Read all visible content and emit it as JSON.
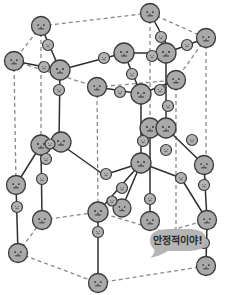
{
  "diagram": {
    "speech_bubble": {
      "text": "안정적이야!"
    },
    "colors": {
      "atom_fill": "#a9a9a9",
      "atom_stroke": "#3a3a3a",
      "bond": "#2e2e2e",
      "cell_edge": "#8a8a8a",
      "bubble": "#b5b5b5",
      "face": "#2a2a2a"
    },
    "oxygen_atoms": [
      {
        "x": 41,
        "y": 26
      },
      {
        "x": 150,
        "y": 13
      },
      {
        "x": 14,
        "y": 61
      },
      {
        "x": 60,
        "y": 70
      },
      {
        "x": 124,
        "y": 53
      },
      {
        "x": 206,
        "y": 38
      },
      {
        "x": 97,
        "y": 87
      },
      {
        "x": 141,
        "y": 94
      },
      {
        "x": 204,
        "y": 79
      },
      {
        "x": 176,
        "y": 80
      },
      {
        "x": 162,
        "y": 131
      },
      {
        "x": 41,
        "y": 145
      },
      {
        "x": 61,
        "y": 142
      },
      {
        "x": 150,
        "y": 128
      },
      {
        "x": 141,
        "y": 163
      },
      {
        "x": 16,
        "y": 185
      },
      {
        "x": 109,
        "y": 213
      },
      {
        "x": 98,
        "y": 212
      },
      {
        "x": 207,
        "y": 220
      },
      {
        "x": 165,
        "y": 232
      },
      {
        "x": 42,
        "y": 220
      },
      {
        "x": 18,
        "y": 253
      },
      {
        "x": 206,
        "y": 266
      },
      {
        "x": 98,
        "y": 283
      },
      {
        "x": 122,
        "y": 208
      },
      {
        "x": 150,
        "y": 221
      },
      {
        "x": 41,
        "y": 174
      }
    ],
    "hydrogen_atoms": [
      {
        "x": 48,
        "y": 44
      },
      {
        "x": 44,
        "y": 66
      },
      {
        "x": 59,
        "y": 89
      },
      {
        "x": 104,
        "y": 60
      },
      {
        "x": 161,
        "y": 37
      },
      {
        "x": 166,
        "y": 43
      },
      {
        "x": 209,
        "y": 53
      },
      {
        "x": 120,
        "y": 91
      },
      {
        "x": 169,
        "y": 98
      },
      {
        "x": 188,
        "y": 94
      },
      {
        "x": 148,
        "y": 78
      },
      {
        "x": 50,
        "y": 143
      },
      {
        "x": 45,
        "y": 158
      },
      {
        "x": 42,
        "y": 178
      },
      {
        "x": 146,
        "y": 106
      },
      {
        "x": 190,
        "y": 140
      },
      {
        "x": 131,
        "y": 140
      },
      {
        "x": 107,
        "y": 162
      },
      {
        "x": 166,
        "y": 147
      },
      {
        "x": 202,
        "y": 181
      },
      {
        "x": 113,
        "y": 176
      },
      {
        "x": 108,
        "y": 203
      },
      {
        "x": 122,
        "y": 188
      },
      {
        "x": 17,
        "y": 206
      },
      {
        "x": 98,
        "y": 232
      },
      {
        "x": 203,
        "y": 240
      },
      {
        "x": 135,
        "y": 150
      }
    ]
  }
}
